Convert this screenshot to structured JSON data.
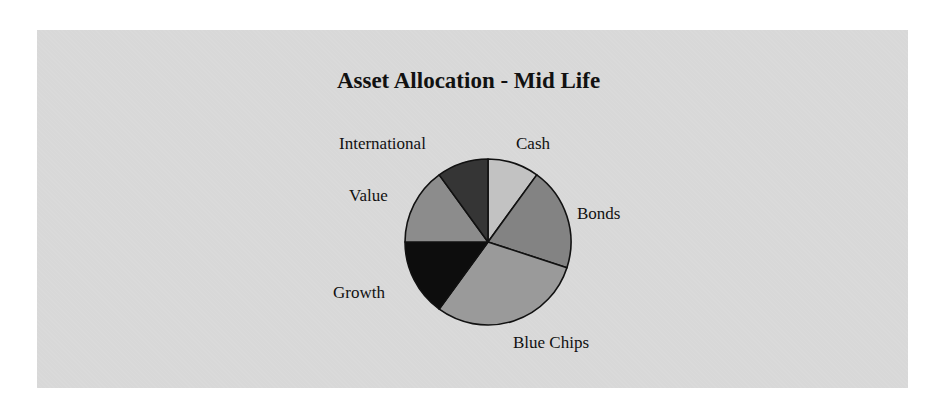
{
  "chart_data": {
    "type": "pie",
    "title": "Asset Allocation - Mid Life",
    "categories": [
      "Cash",
      "Bonds",
      "Blue Chips",
      "Growth",
      "Value",
      "International"
    ],
    "values": [
      10,
      20,
      30,
      15,
      15,
      10
    ],
    "colors": [
      "#c2c2c2",
      "#838383",
      "#9a9a9a",
      "#0d0d0d",
      "#8c8c8c",
      "#353535"
    ],
    "start_angle_deg": 0,
    "direction": "clockwise",
    "legend": "none (data labels beside slices)"
  },
  "labels": {
    "cash": "Cash",
    "bonds": "Bonds",
    "blue_chips": "Blue Chips",
    "growth": "Growth",
    "value": "Value",
    "international": "International"
  },
  "style": {
    "panel_bg": "#d8d8d8",
    "page_bg": "#ffffff",
    "outline": "#111111"
  }
}
